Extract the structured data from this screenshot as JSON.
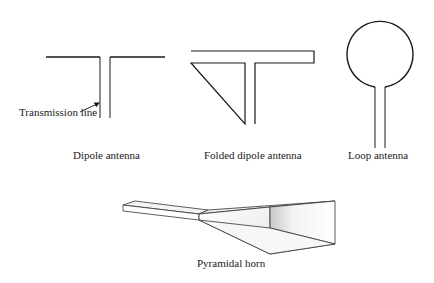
{
  "diagram": {
    "dipole": {
      "label": "Dipole antenna",
      "annotation": "Transmission line"
    },
    "folded_dipole": {
      "label": "Folded dipole antenna"
    },
    "loop": {
      "label": "Loop antenna"
    },
    "horn": {
      "label": "Pyramidal horn"
    },
    "colors": {
      "stroke": "#1a1a1a",
      "background": "#ffffff"
    }
  }
}
